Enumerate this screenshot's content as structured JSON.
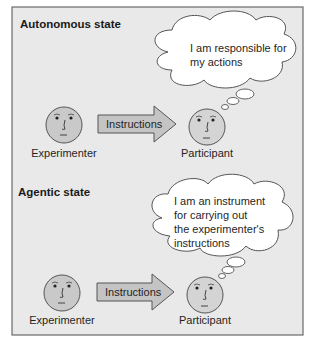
{
  "panels": [
    {
      "title": "Autonomous state",
      "experimenter_label": "Experimenter",
      "arrow_label": "Instructions",
      "participant_label": "Participant",
      "thought_lines": [
        "I am responsible for",
        "my actions"
      ]
    },
    {
      "title": "Agentic state",
      "experimenter_label": "Experimenter",
      "arrow_label": "Instructions",
      "participant_label": "Participant",
      "thought_lines": [
        "I am an instrument",
        "for carrying out",
        "the experimenter's",
        "instructions"
      ]
    }
  ],
  "colors": {
    "background": "#e9e9e9",
    "frame": "#6a6a6a",
    "face_fill": "#c9c9c9",
    "arrow_fill": "#c4c4c4",
    "bubble_fill": "#ffffff"
  }
}
